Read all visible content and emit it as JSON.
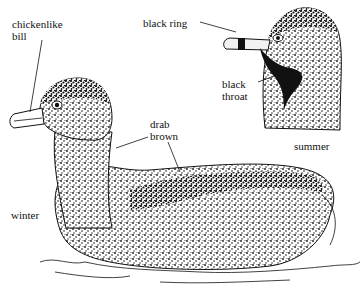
{
  "figure": {
    "labels": {
      "chickenlike_bill": [
        "chickenlike",
        "bill"
      ],
      "black_ring": "black ring",
      "black_throat": [
        "black",
        "throat"
      ],
      "drab_brown": [
        "drab",
        "brown"
      ],
      "summer": "summer",
      "winter": "winter"
    },
    "colors": {
      "ink": "#111111",
      "paper": "#ffffff",
      "bill_pale": "#f2f2f2"
    }
  }
}
